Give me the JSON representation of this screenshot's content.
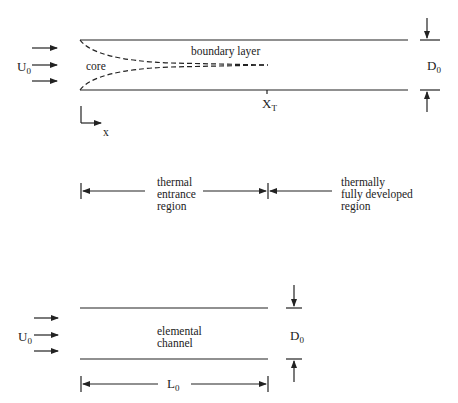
{
  "diagram": {
    "top": {
      "inlet_velocity": "U",
      "inlet_velocity_sub": "0",
      "core_label": "core",
      "boundary_layer_label": "boundary layer",
      "transition_label": "X",
      "transition_sub": "T",
      "diameter_label": "D",
      "diameter_sub": "0",
      "axis_label": "x"
    },
    "regions": {
      "entrance": [
        "thermal",
        "entrance",
        "region"
      ],
      "developed": [
        "thermally",
        "fully developed",
        "region"
      ]
    },
    "bottom": {
      "inlet_velocity": "U",
      "inlet_velocity_sub": "0",
      "channel_label": [
        "elemental",
        "channel"
      ],
      "diameter_label": "D",
      "diameter_sub": "0",
      "length_label": "L",
      "length_sub": "0"
    }
  }
}
